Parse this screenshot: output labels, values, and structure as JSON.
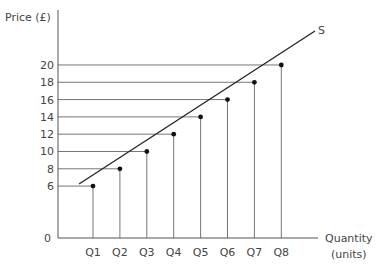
{
  "chart_data": {
    "type": "line",
    "title": "",
    "xlabel": "Quantity (units)",
    "xlabel_lines": [
      "Quantity",
      "(units)"
    ],
    "ylabel": "Price (£)",
    "series_label": "S",
    "origin_label": "0",
    "categories": [
      "Q1",
      "Q2",
      "Q3",
      "Q4",
      "Q5",
      "Q6",
      "Q7",
      "Q8"
    ],
    "y_ticks": [
      6,
      8,
      10,
      12,
      14,
      16,
      18,
      20
    ],
    "series": [
      {
        "name": "S",
        "x": [
          "Q1",
          "Q2",
          "Q3",
          "Q4",
          "Q5",
          "Q6",
          "Q7",
          "Q8"
        ],
        "values": [
          6,
          8,
          10,
          12,
          14,
          16,
          18,
          20
        ]
      }
    ],
    "ylim": [
      0,
      22
    ],
    "grid": false,
    "dashed_guides": true,
    "legend": "none"
  }
}
